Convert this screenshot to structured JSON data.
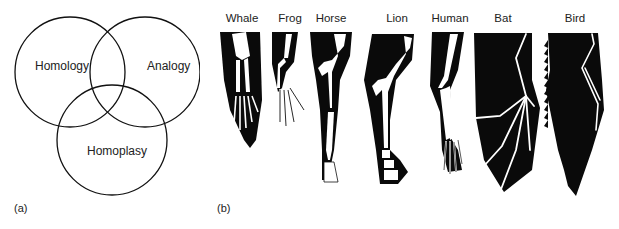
{
  "panel_a": {
    "label": "(a)",
    "venn": {
      "circles": [
        {
          "name": "Homology",
          "cx": 70,
          "cy": 72,
          "r": 55
        },
        {
          "name": "Analogy",
          "cx": 145,
          "cy": 72,
          "r": 55
        },
        {
          "name": "Homoplasy",
          "cx": 112,
          "cy": 140,
          "r": 55
        }
      ],
      "labels": {
        "homology": "Homology",
        "analogy": "Analogy",
        "homoplasy": "Homoplasy"
      }
    }
  },
  "panel_b": {
    "label": "(b)",
    "limbs": [
      {
        "name": "Whale"
      },
      {
        "name": "Frog"
      },
      {
        "name": "Horse"
      },
      {
        "name": "Lion"
      },
      {
        "name": "Human"
      },
      {
        "name": "Bat"
      },
      {
        "name": "Bird"
      }
    ]
  },
  "colors": {
    "stroke": "#111111",
    "silhouette": "#0a0a0a",
    "bone": "#ffffff"
  }
}
